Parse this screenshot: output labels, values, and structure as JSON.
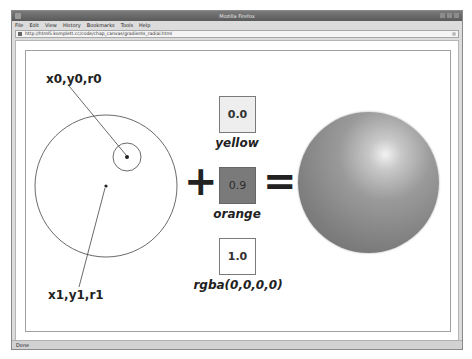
{
  "window": {
    "title": "Mozilla Firefox",
    "menu": [
      "File",
      "Edit",
      "View",
      "History",
      "Bookmarks",
      "Tools",
      "Help"
    ],
    "url": "http://html5.komplett.cc/code/chap_canvas/gradients_radial.html",
    "status": "Done"
  },
  "diagram": {
    "start_circle_label": "x0,y0,r0",
    "end_circle_label": "x1,y1,r1",
    "plus_symbol": "+",
    "equals_symbol": "=",
    "color_stops": [
      {
        "offset": "0.0",
        "name": "yellow",
        "fill": "#eeeeee"
      },
      {
        "offset": "0.9",
        "name": "orange",
        "fill": "#7a7a7a"
      },
      {
        "offset": "1.0",
        "name": "rgba(0,0,0,0)",
        "fill": "#ffffff"
      }
    ],
    "colors": {
      "stroke": "#444444",
      "sphere_highlight": "#f2f2f2",
      "sphere_body": "#8a8a8a"
    }
  }
}
